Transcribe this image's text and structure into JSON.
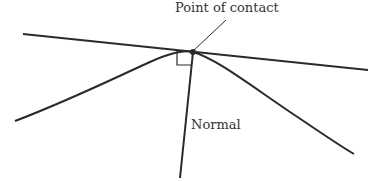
{
  "diagram": {
    "labels": {
      "contact": "Point of contact",
      "normal": "Normal"
    },
    "colors": {
      "stroke": "#2a2a2a",
      "text": "#333333"
    }
  }
}
